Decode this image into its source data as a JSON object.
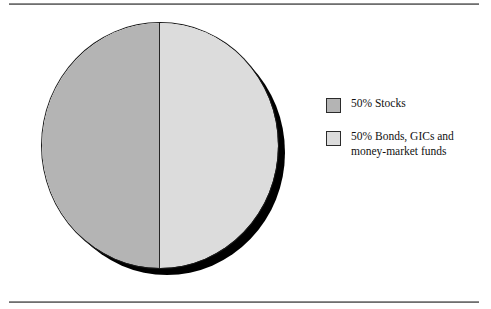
{
  "figure": {
    "background_color": "#ffffff",
    "rule_color": "#6f6f6f",
    "top_rule_name": "top-rule",
    "bottom_rule_name": "bottom-rule"
  },
  "chart_data": {
    "type": "pie",
    "title": "",
    "subtitle": "",
    "xlabel": "",
    "ylabel": "",
    "grid": false,
    "legend_position": "right",
    "has_drop_shadow": true,
    "shadow_color": "#000000",
    "outline_color": "#1a1a1a",
    "divider_color": "#262626",
    "categories": [
      "50% Stocks",
      "50% Bonds, GICs and money-market funds"
    ],
    "values": [
      50,
      50
    ],
    "units": "percent",
    "colors": [
      "#b4b4b4",
      "#dcdcdc"
    ],
    "slices": [
      {
        "label": "50% Stocks",
        "value": 50,
        "color": "#b4b4b4",
        "start_angle": 180,
        "end_angle": 360
      },
      {
        "label": "50% Bonds, GICs and money-market funds",
        "value": 50,
        "color": "#dcdcdc",
        "start_angle": 0,
        "end_angle": 180
      }
    ]
  },
  "legend": {
    "items": [
      {
        "label": "50% Stocks",
        "color": "#b4b4b4"
      },
      {
        "label": "50% Bonds, GICs and\nmoney-market funds",
        "color": "#dcdcdc"
      }
    ]
  }
}
